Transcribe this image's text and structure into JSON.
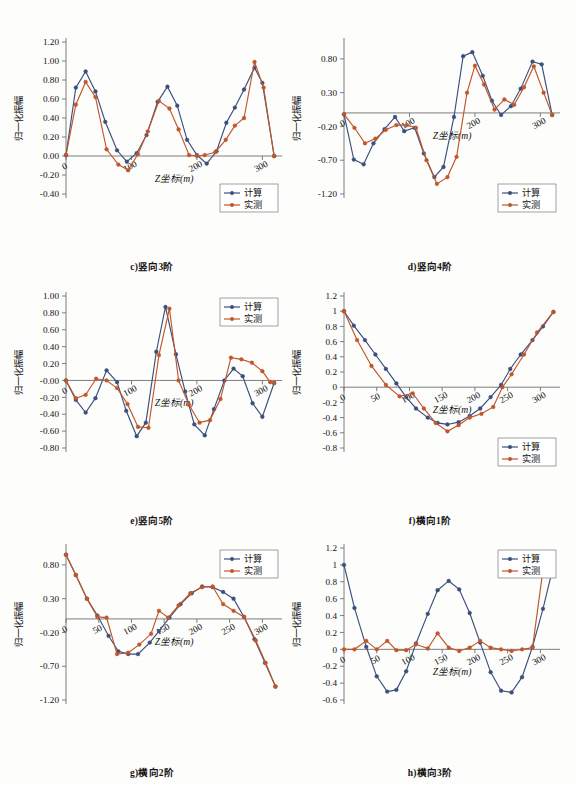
{
  "figure": {
    "title": "",
    "legend_labels": {
      "calculated": "计算",
      "measured": "实测"
    },
    "colors": {
      "calculated": "#3b4f7d",
      "measured": "#c0562a",
      "axis": "#6f6f6f",
      "text": "#111111"
    },
    "axis_titles": {
      "x": "Z坐标(m)",
      "y": "归一化振幅"
    }
  },
  "chart_data": [
    {
      "id": "c",
      "type": "line",
      "title": "c)竖向3阶",
      "xlabel": "Z坐标(m)",
      "ylabel": "归一化振幅",
      "xlim": [
        0,
        330
      ],
      "ylim": [
        -0.4,
        1.2
      ],
      "xticks": [
        0,
        100,
        200,
        300
      ],
      "yticks": [
        -0.4,
        -0.2,
        0.0,
        0.2,
        0.4,
        0.6,
        0.8,
        1.0,
        1.2
      ],
      "ytick_labels": [
        "-0.40",
        "-0.20",
        "0.00",
        "0.20",
        "0.40",
        "0.60",
        "0.80",
        "1.00",
        "1.20"
      ],
      "grid": false,
      "legend_position": "bottom-right",
      "series": [
        {
          "name": "计算",
          "x": [
            0,
            15,
            30,
            45,
            60,
            78,
            93,
            108,
            123,
            140,
            155,
            170,
            185,
            200,
            215,
            230,
            245,
            258,
            272,
            288,
            300,
            318
          ],
          "values": [
            0.01,
            0.72,
            0.89,
            0.68,
            0.36,
            0.06,
            -0.06,
            0.03,
            0.22,
            0.57,
            0.73,
            0.53,
            0.17,
            0.01,
            -0.08,
            0.05,
            0.35,
            0.51,
            0.7,
            0.93,
            0.77,
            0.0
          ]
        },
        {
          "name": "实测",
          "x": [
            0,
            15,
            30,
            45,
            62,
            80,
            95,
            110,
            125,
            142,
            158,
            172,
            188,
            200,
            212,
            228,
            244,
            258,
            272,
            288,
            302,
            318
          ],
          "values": [
            0.01,
            0.54,
            0.78,
            0.62,
            0.07,
            -0.09,
            -0.15,
            0.02,
            0.26,
            0.58,
            0.5,
            0.28,
            0.01,
            0.0,
            0.01,
            0.04,
            0.17,
            0.32,
            0.4,
            0.99,
            0.72,
            0.0
          ]
        }
      ]
    },
    {
      "id": "d",
      "type": "line",
      "title": "d)竖向4阶",
      "xlabel": "Z坐标(m)",
      "ylabel": "归一化振幅",
      "xlim": [
        0,
        330
      ],
      "ylim": [
        -1.2,
        1.05
      ],
      "xticks": [
        0,
        100,
        200,
        300
      ],
      "yticks": [
        -1.2,
        -0.7,
        -0.2,
        0.3,
        0.8
      ],
      "ytick_labels": [
        "-1.20",
        "-0.70",
        "-0.20",
        "0.30",
        "0.80"
      ],
      "grid": false,
      "legend_position": "bottom-right",
      "series": [
        {
          "name": "计算",
          "x": [
            0,
            15,
            30,
            45,
            62,
            78,
            92,
            108,
            122,
            138,
            152,
            168,
            182,
            196,
            212,
            226,
            240,
            255,
            270,
            288,
            302,
            318
          ],
          "values": [
            -0.02,
            -0.69,
            -0.76,
            -0.45,
            -0.24,
            -0.06,
            -0.27,
            -0.22,
            -0.6,
            -0.95,
            -0.8,
            -0.06,
            0.84,
            0.9,
            0.55,
            0.18,
            -0.03,
            0.1,
            0.36,
            0.76,
            0.72,
            -0.03
          ]
        },
        {
          "name": "实测",
          "x": [
            0,
            16,
            32,
            48,
            64,
            80,
            96,
            110,
            126,
            142,
            158,
            172,
            188,
            200,
            214,
            230,
            245,
            260,
            275,
            290,
            305,
            318
          ],
          "values": [
            -0.02,
            -0.22,
            -0.45,
            -0.38,
            -0.25,
            -0.18,
            -0.18,
            -0.22,
            -0.7,
            -1.05,
            -0.95,
            -0.65,
            0.3,
            0.7,
            0.42,
            0.05,
            0.2,
            0.12,
            0.38,
            0.69,
            0.3,
            -0.03
          ]
        }
      ]
    },
    {
      "id": "e",
      "type": "line",
      "title": "e)竖向5阶",
      "xlabel": "Z坐标(m)",
      "ylabel": "归一化振幅",
      "xlim": [
        0,
        330
      ],
      "ylim": [
        -0.8,
        1.0
      ],
      "xticks": [
        0,
        100,
        200,
        300
      ],
      "yticks": [
        -0.8,
        -0.6,
        -0.4,
        -0.2,
        0.0,
        0.2,
        0.4,
        0.6,
        0.8,
        1.0
      ],
      "ytick_labels": [
        "-0.80",
        "-0.60",
        "-0.40",
        "-0.20",
        "-0.00",
        "0.20",
        "0.40",
        "0.60",
        "0.80",
        "1.00"
      ],
      "grid": false,
      "legend_position": "top-right",
      "series": [
        {
          "name": "计算",
          "x": [
            0,
            15,
            30,
            45,
            62,
            78,
            92,
            108,
            122,
            138,
            152,
            168,
            182,
            196,
            212,
            226,
            242,
            256,
            270,
            285,
            300,
            318
          ],
          "values": [
            0.0,
            -0.23,
            -0.38,
            -0.21,
            0.12,
            -0.02,
            -0.36,
            -0.66,
            -0.5,
            0.34,
            0.87,
            0.31,
            -0.13,
            -0.52,
            -0.65,
            -0.34,
            0.0,
            0.14,
            0.05,
            -0.27,
            -0.43,
            -0.03
          ]
        },
        {
          "name": "实测",
          "x": [
            0,
            15,
            30,
            46,
            62,
            78,
            94,
            110,
            126,
            142,
            158,
            172,
            188,
            204,
            220,
            236,
            252,
            268,
            284,
            300,
            312,
            318
          ],
          "values": [
            0.0,
            -0.21,
            -0.17,
            0.02,
            0.0,
            -0.09,
            -0.28,
            -0.55,
            -0.56,
            0.3,
            0.85,
            0.0,
            -0.29,
            -0.5,
            -0.47,
            -0.22,
            0.27,
            0.25,
            0.21,
            0.11,
            -0.02,
            -0.03
          ]
        }
      ]
    },
    {
      "id": "f",
      "type": "line",
      "title": "f)横向1阶",
      "xlabel": "Z坐标(m)",
      "ylabel": "归一化振幅",
      "xlim": [
        0,
        330
      ],
      "ylim": [
        -0.8,
        1.2
      ],
      "xticks": [
        0,
        50,
        100,
        150,
        200,
        250,
        300
      ],
      "yticks": [
        -0.8,
        -0.6,
        -0.4,
        -0.2,
        0,
        0.2,
        0.4,
        0.6,
        0.8,
        1,
        1.2
      ],
      "ytick_labels": [
        "-0.8",
        "-0.6",
        "-0.4",
        "-0.2",
        "0",
        "0.2",
        "0.4",
        "0.6",
        "0.8",
        "1",
        "1.2"
      ],
      "grid": false,
      "legend_position": "bottom-right",
      "series": [
        {
          "name": "计算",
          "x": [
            0,
            15,
            32,
            48,
            64,
            80,
            95,
            110,
            128,
            143,
            158,
            175,
            192,
            208,
            224,
            240,
            254,
            270,
            288,
            304,
            320
          ],
          "values": [
            1.0,
            0.81,
            0.62,
            0.43,
            0.24,
            0.05,
            -0.13,
            -0.28,
            -0.4,
            -0.47,
            -0.49,
            -0.46,
            -0.38,
            -0.28,
            -0.13,
            0.03,
            0.24,
            0.43,
            0.62,
            0.8,
            0.99
          ]
        },
        {
          "name": "实测",
          "x": [
            0,
            20,
            42,
            64,
            85,
            105,
            122,
            140,
            158,
            175,
            192,
            210,
            228,
            242,
            256,
            275,
            295,
            320
          ],
          "values": [
            1.0,
            0.62,
            0.28,
            0.03,
            -0.12,
            -0.08,
            -0.28,
            -0.47,
            -0.58,
            -0.5,
            -0.4,
            -0.35,
            -0.26,
            0.0,
            0.17,
            0.43,
            0.72,
            0.99
          ]
        }
      ]
    },
    {
      "id": "g",
      "type": "line",
      "title": "g)横向2阶",
      "xlabel": "Z坐标(m)",
      "ylabel": "归一化振幅",
      "xlim": [
        0,
        330
      ],
      "ylim": [
        -1.2,
        1.05
      ],
      "xticks": [
        0,
        50,
        100,
        150,
        200,
        250,
        300
      ],
      "yticks": [
        -1.2,
        -0.7,
        -0.2,
        0.3,
        0.8
      ],
      "ytick_labels": [
        "-1.20",
        "-0.70",
        "-0.20",
        "0.30",
        "0.80"
      ],
      "grid": false,
      "legend_position": "top-right",
      "series": [
        {
          "name": "计算",
          "x": [
            0,
            15,
            32,
            48,
            65,
            80,
            95,
            110,
            128,
            142,
            158,
            175,
            192,
            208,
            224,
            240,
            256,
            272,
            288,
            304,
            320
          ],
          "values": [
            0.95,
            0.65,
            0.3,
            0.05,
            -0.25,
            -0.48,
            -0.52,
            -0.52,
            -0.35,
            -0.18,
            0.02,
            0.22,
            0.38,
            0.48,
            0.47,
            0.4,
            0.3,
            0.03,
            -0.3,
            -0.65,
            -1.0
          ]
        },
        {
          "name": "实测",
          "x": [
            0,
            15,
            32,
            48,
            62,
            78,
            95,
            112,
            130,
            142,
            156,
            172,
            190,
            208,
            224,
            240,
            256,
            272,
            290,
            305,
            320
          ],
          "values": [
            0.95,
            0.65,
            0.3,
            0.03,
            0.02,
            -0.52,
            -0.5,
            -0.38,
            -0.22,
            0.12,
            0.02,
            0.2,
            0.38,
            0.47,
            0.48,
            0.22,
            0.12,
            0.03,
            -0.32,
            -0.65,
            -1.0
          ]
        }
      ]
    },
    {
      "id": "h",
      "type": "line",
      "title": "h)横向3阶",
      "xlabel": "Z坐标(m)",
      "ylabel": "归一化振幅",
      "xlim": [
        0,
        330
      ],
      "ylim": [
        -0.6,
        1.2
      ],
      "xticks": [
        0,
        50,
        100,
        150,
        200,
        250,
        300
      ],
      "yticks": [
        -0.6,
        -0.4,
        -0.2,
        0,
        0.2,
        0.4,
        0.6,
        0.8,
        1,
        1.2
      ],
      "ytick_labels": [
        "-0.6",
        "-0.4",
        "-0.2",
        "0",
        "0.2",
        "0.4",
        "0.6",
        "0.8",
        "1",
        "1.2"
      ],
      "grid": false,
      "legend_position": "top-right",
      "series": [
        {
          "name": "计算",
          "x": [
            0,
            16,
            34,
            50,
            66,
            80,
            95,
            110,
            128,
            143,
            160,
            176,
            192,
            208,
            224,
            240,
            256,
            272,
            288,
            304,
            320
          ],
          "values": [
            1.0,
            0.49,
            0.03,
            -0.32,
            -0.5,
            -0.48,
            -0.26,
            0.07,
            0.42,
            0.7,
            0.81,
            0.71,
            0.43,
            0.08,
            -0.27,
            -0.49,
            -0.51,
            -0.33,
            0.03,
            0.48,
            0.99
          ]
        },
        {
          "name": "实测",
          "x": [
            0,
            16,
            34,
            50,
            66,
            80,
            95,
            110,
            128,
            143,
            160,
            176,
            192,
            208,
            224,
            240,
            256,
            272,
            288,
            305
          ],
          "values": [
            0.0,
            0.0,
            0.1,
            0.0,
            0.1,
            -0.01,
            -0.01,
            0.06,
            0.01,
            0.19,
            0.02,
            -0.02,
            0.02,
            0.1,
            0.02,
            0.0,
            -0.02,
            0.0,
            0.02,
            1.0
          ]
        }
      ]
    }
  ],
  "layout": {
    "panels": [
      {
        "id": "c",
        "left": 8,
        "top": 24
      },
      {
        "id": "d",
        "left": 286,
        "top": 24
      },
      {
        "id": "e",
        "top": 278,
        "left": 8
      },
      {
        "id": "f",
        "top": 278,
        "left": 286
      },
      {
        "id": "g",
        "top": 530,
        "left": 8
      },
      {
        "id": "h",
        "top": 530,
        "left": 286
      }
    ]
  }
}
